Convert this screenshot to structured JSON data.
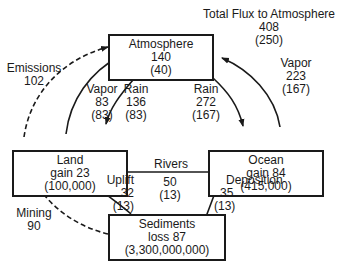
{
  "title": {
    "text": "Total Flux to Atmosphere",
    "value": "408",
    "sub": "(250)"
  },
  "nodes": {
    "atmosphere": {
      "name": "Atmosphere",
      "value": "140",
      "sub": "(40)"
    },
    "land": {
      "name": "Land",
      "value": "gain 23",
      "sub": "(100,000)"
    },
    "ocean": {
      "name": "Ocean",
      "value": "gain 84",
      "sub": "(415,000)"
    },
    "sediments": {
      "name": "Sediments",
      "value": "loss 87",
      "sub": "(3,300,000,000)"
    }
  },
  "flows": {
    "emissions": {
      "name": "Emissions",
      "value": "102"
    },
    "land_vapor": {
      "name": "Vapor",
      "value": "83",
      "sub": "(83)"
    },
    "land_rain": {
      "name": "Rain",
      "value": "136",
      "sub": "(83)"
    },
    "ocean_rain": {
      "name": "Rain",
      "value": "272",
      "sub": "(167)"
    },
    "ocean_vapor": {
      "name": "Vapor",
      "value": "223",
      "sub": "(167)"
    },
    "rivers": {
      "name": "Rivers",
      "value": "50",
      "sub": "(13)"
    },
    "uplift": {
      "name": "Uplift",
      "value": "32",
      "sub": "(13)"
    },
    "deposition": {
      "name": "Deposition",
      "value": "35",
      "sub": "(13)"
    },
    "mining": {
      "name": "Mining",
      "value": "90"
    }
  }
}
